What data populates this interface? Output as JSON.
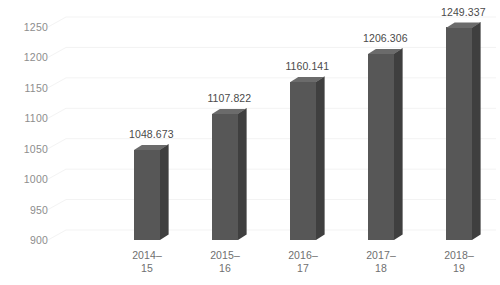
{
  "chart_data": {
    "type": "bar",
    "title": "",
    "subtitle": "",
    "xlabel": "",
    "ylabel": "",
    "categories": [
      "2014–15",
      "2015–16",
      "2016–17",
      "2017–18",
      "2018–19"
    ],
    "category_lines": [
      [
        "2014–",
        "15"
      ],
      [
        "2015–",
        "16"
      ],
      [
        "2016–",
        "17"
      ],
      [
        "2017–",
        "18"
      ],
      [
        "2018–",
        "19"
      ]
    ],
    "values": [
      1048.673,
      1107.822,
      1160.141,
      1206.306,
      1249.337
    ],
    "data_labels": [
      "1048.673",
      "1107.822",
      "1160.141",
      "1206.306",
      "1249.337"
    ],
    "ylim": [
      900,
      1270
    ],
    "yticks": [
      900,
      950,
      1000,
      1050,
      1100,
      1150,
      1200,
      1250
    ],
    "ytick_labels": [
      "900",
      "950",
      "1000",
      "1050",
      "1100",
      "1150",
      "1200",
      "1250"
    ],
    "grid": true,
    "grid_axis": "y",
    "legend": false,
    "legend_position": "none",
    "style_3d": true,
    "series": [
      {
        "name": "Value",
        "values": [
          1048.673,
          1107.822,
          1160.141,
          1206.306,
          1249.337
        ]
      }
    ],
    "colors": {
      "bar_front": "#575757",
      "bar_side": "#3f3f3f",
      "bar_top": "#6b6b6b",
      "gridline": "#f3f3f3",
      "tick_text": "#8d8d8d",
      "label_text": "#4a4a4a",
      "category_text": "#6f6f6f",
      "background": "#ffffff"
    }
  }
}
